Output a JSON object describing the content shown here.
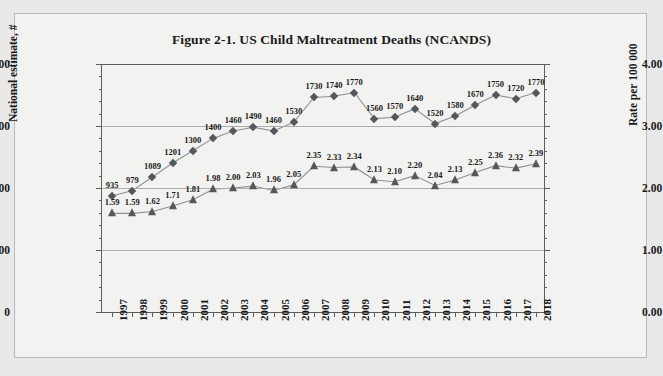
{
  "figure": {
    "title": "Figure 2-1. US Child Maltreatment Deaths (NCANDS)",
    "panel_background": "#f2f2f1",
    "page_background": "#e9e9e9",
    "border_color": "#b9b9b9",
    "marker_color": "#54585c",
    "line_color": "#8c9196",
    "gridline_color": "#adadad",
    "axis_color": "#5d5d5d"
  },
  "chart_data": {
    "type": "line",
    "title": "Figure 2-1. US Child Maltreatment Deaths (NCANDS)",
    "xlabel": "",
    "ylabel": "National estimate, #",
    "y2label": "Rate per 100 000",
    "grid": true,
    "legend": "none",
    "ylim": [
      0,
      2000
    ],
    "y2lim": [
      0.0,
      4.0
    ],
    "yticks": [
      0,
      500,
      1000,
      1500,
      2000
    ],
    "ytick_labels": [
      "0",
      "500",
      "1000",
      "1500",
      "2000"
    ],
    "y2ticks": [
      0.0,
      1.0,
      2.0,
      3.0,
      4.0
    ],
    "y2tick_labels": [
      "0.00",
      "1.00",
      "2.00",
      "3.00",
      "4.00"
    ],
    "categories": [
      "1997",
      "1998",
      "1999",
      "2000",
      "2001",
      "2002",
      "2003",
      "2004",
      "2005",
      "2006",
      "2007",
      "2008",
      "2009",
      "2010",
      "2011",
      "2012",
      "2013",
      "2014",
      "2015",
      "2016",
      "2017",
      "2018"
    ],
    "series": [
      {
        "name": "National estimate, #",
        "axis": "left",
        "marker": "diamond",
        "values": [
          935,
          979,
          1089,
          1201,
          1300,
          1400,
          1460,
          1490,
          1460,
          1530,
          1730,
          1740,
          1770,
          1560,
          1570,
          1640,
          1520,
          1580,
          1670,
          1750,
          1720,
          1770
        ],
        "labels": [
          "935",
          "979",
          "1089",
          "1201",
          "1300",
          "1400",
          "1460",
          "1490",
          "1460",
          "1530",
          "1730",
          "1740",
          "1770",
          "1560",
          "1570",
          "1640",
          "1520",
          "1580",
          "1670",
          "1750",
          "1720",
          "1770"
        ]
      },
      {
        "name": "Rate per 100 000",
        "axis": "right",
        "marker": "triangle",
        "values": [
          1.59,
          1.59,
          1.62,
          1.71,
          1.81,
          1.98,
          2.0,
          2.03,
          1.96,
          2.05,
          2.35,
          2.33,
          2.34,
          2.13,
          2.1,
          2.2,
          2.04,
          2.13,
          2.25,
          2.36,
          2.32,
          2.39
        ],
        "labels": [
          "1.59",
          "1.59",
          "1.62",
          "1.71",
          "1.81",
          "1.98",
          "2.00",
          "2.03",
          "1.96",
          "2.05",
          "2.35",
          "2.33",
          "2.34",
          "2.13",
          "2.10",
          "2.20",
          "2.04",
          "2.13",
          "2.25",
          "2.36",
          "2.32",
          "2.39"
        ]
      }
    ]
  }
}
